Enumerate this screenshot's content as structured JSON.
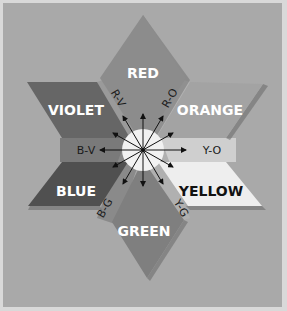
{
  "diagram": {
    "primary_secondary": [
      {
        "id": "red",
        "label": "RED",
        "fill": "#8c8c8c",
        "text_color": "#ffffff"
      },
      {
        "id": "orange",
        "label": "ORANGE",
        "fill": "#a3a3a3",
        "text_color": "#ffffff"
      },
      {
        "id": "yellow",
        "label": "YELLOW",
        "fill": "#eeeeee",
        "text_color": "#111111"
      },
      {
        "id": "green",
        "label": "GREEN",
        "fill": "#7f7f7f",
        "text_color": "#ffffff"
      },
      {
        "id": "blue",
        "label": "BLUE",
        "fill": "#505050",
        "text_color": "#ffffff"
      },
      {
        "id": "violet",
        "label": "VIOLET",
        "fill": "#666666",
        "text_color": "#ffffff"
      }
    ],
    "intermediates": [
      {
        "id": "red-violet",
        "label": "R-V"
      },
      {
        "id": "red-orange",
        "label": "R-O"
      },
      {
        "id": "yellow-orange",
        "label": "Y-O"
      },
      {
        "id": "yellow-green",
        "label": "Y-G"
      },
      {
        "id": "blue-green",
        "label": "B-G"
      },
      {
        "id": "blue-violet",
        "label": "B-V"
      }
    ],
    "center": {
      "fill": "#f2f2f2",
      "arrow_count": 12
    },
    "background": {
      "outer": "#d9d9d9",
      "inner": "#a9a9a9"
    }
  }
}
